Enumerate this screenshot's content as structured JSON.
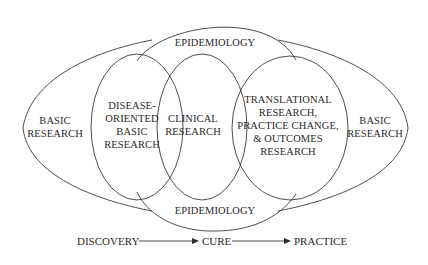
{
  "diagram": {
    "regions": {
      "epidemiology_top": "EPIDEMIOLOGY",
      "epidemiology_bottom": "EPIDEMIOLOGY",
      "basic_research_left": [
        "BASIC",
        "RESEARCH"
      ],
      "basic_research_right": [
        "BASIC",
        "RESEARCH"
      ],
      "disease_oriented": [
        "DISEASE-",
        "ORIENTED",
        "BASIC",
        "RESEARCH"
      ],
      "clinical": [
        "CLINICAL",
        "RESEARCH"
      ],
      "translational": [
        "TRANSLATIONAL",
        "RESEARCH,",
        "PRACTICE CHANGE,",
        "& OUTCOMES",
        "RESEARCH"
      ]
    },
    "flow": {
      "steps": [
        "DISCOVERY",
        "CURE",
        "PRACTICE"
      ]
    },
    "colors": {
      "stroke": "#3a3a3a",
      "text": "#2a2a2a",
      "background": "#ffffff"
    }
  }
}
